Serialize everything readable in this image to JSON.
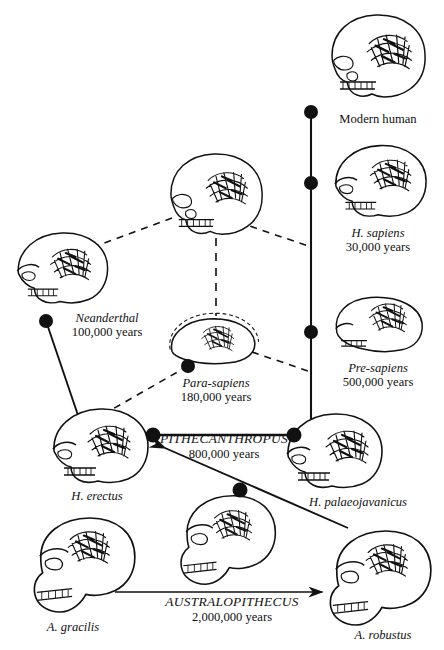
{
  "figure": {
    "type": "diagram",
    "background": "#ffffff",
    "ink": "#111111",
    "width": 444,
    "height": 650
  },
  "taxa": [
    {
      "id": "modern-human",
      "name": "Modern human",
      "age": "",
      "name_style": "roman",
      "cx": 378,
      "cy": 62,
      "label_x": 378,
      "label_y": 112
    },
    {
      "id": "h-sapiens",
      "name": "H. sapiens",
      "age": "30,000 years",
      "name_style": "italic",
      "cx": 380,
      "cy": 185,
      "label_x": 378,
      "label_y": 232
    },
    {
      "id": "pre-sapiens",
      "name": "Pre-sapiens",
      "age": "500,000 years",
      "name_style": "italic",
      "cx": 378,
      "cy": 325,
      "label_x": 378,
      "label_y": 367
    },
    {
      "id": "neanderthal",
      "name": "Neanderthal",
      "age": "100,000 years",
      "name_style": "italic",
      "cx": 62,
      "cy": 272,
      "label_x": 107,
      "label_y": 314
    },
    {
      "id": "para-sapiens",
      "name": "Para-sapiens",
      "age": "180,000 years",
      "name_style": "italic",
      "cx": 212,
      "cy": 340,
      "label_x": 216,
      "label_y": 379
    },
    {
      "id": "h-erectus",
      "name": "H. erectus",
      "age": "",
      "name_style": "italic",
      "cx": 100,
      "cy": 450,
      "label_x": 97,
      "label_y": 486
    },
    {
      "id": "h-palaeojavanicus",
      "name": "H. palaeojavanicus",
      "age": "",
      "name_style": "italic",
      "cx": 334,
      "cy": 455,
      "label_x": 356,
      "label_y": 500
    },
    {
      "id": "a-gracilis",
      "name": "A. gracilis",
      "age": "",
      "name_style": "italic",
      "cx": 73,
      "cy": 565,
      "label_x": 73,
      "label_y": 627
    },
    {
      "id": "a-robustus",
      "name": "A. robustus",
      "age": "",
      "name_style": "italic",
      "cx": 378,
      "cy": 578,
      "label_x": 382,
      "label_y": 635
    },
    {
      "id": "unnamed-middle",
      "name": "",
      "age": "",
      "name_style": "italic",
      "cx": 216,
      "cy": 200,
      "label_x": 0,
      "label_y": 0
    },
    {
      "id": "unnamed-lower",
      "name": "",
      "age": "",
      "name_style": "italic",
      "cx": 222,
      "cy": 540,
      "label_x": 0,
      "label_y": 0
    }
  ],
  "group_labels": [
    {
      "id": "pithecanthropus",
      "name": "PITHECANTHROPUS",
      "age": "800,000 years",
      "x": 222,
      "y": 434
    },
    {
      "id": "australopithecus",
      "name": "AUSTRALOPITHECUS",
      "age": "2,000,000 years",
      "x": 232,
      "y": 597
    }
  ],
  "nodes": [
    {
      "id": "node-modern-human",
      "x": 311,
      "y": 112,
      "r": 7.0
    },
    {
      "id": "node-h-sapiens",
      "x": 311,
      "y": 183,
      "r": 7.0
    },
    {
      "id": "node-pre-sapiens",
      "x": 311,
      "y": 332,
      "r": 7.0
    },
    {
      "id": "node-neanderthal",
      "x": 46,
      "y": 321,
      "r": 7.0
    },
    {
      "id": "node-para-sapiens",
      "x": 188,
      "y": 366,
      "r": 7.0
    },
    {
      "id": "node-pithec-left",
      "x": 153,
      "y": 435,
      "r": 7.5
    },
    {
      "id": "node-pithec-right",
      "x": 294,
      "y": 435,
      "r": 7.5
    },
    {
      "id": "node-australo",
      "x": 240,
      "y": 490,
      "r": 7.5
    }
  ],
  "edges": [
    {
      "id": "edge-right-trunk",
      "style": "solid",
      "from": "node-modern-human",
      "to": "node-pre-sapiens"
    },
    {
      "id": "edge-trunk-tail",
      "style": "solid",
      "from": "node-pre-sapiens",
      "to": "trunk-bottom"
    },
    {
      "id": "edge-neanderthal-erectus",
      "style": "solid",
      "from": "node-neanderthal",
      "to": "h-erectus-skull"
    },
    {
      "id": "edge-pithecanthropus",
      "style": "solid",
      "from": "node-pithec-left",
      "to": "node-pithec-right"
    },
    {
      "id": "edge-mid-to-neanderthal",
      "style": "dashed",
      "from": "unnamed-middle",
      "to": "neanderthal-skull"
    },
    {
      "id": "edge-mid-to-sapiens",
      "style": "dashed",
      "from": "unnamed-middle",
      "to": "h-sapiens-branch"
    },
    {
      "id": "edge-mid-to-para",
      "style": "dashed",
      "from": "unnamed-middle",
      "to": "para-sapiens-skull"
    },
    {
      "id": "edge-para-to-erectus",
      "style": "dashed",
      "from": "node-para-sapiens",
      "to": "h-erectus-skull"
    },
    {
      "id": "edge-para-to-presapiens",
      "style": "dashed",
      "from": "para-sapiens-skull",
      "to": "pre-sapiens-branch"
    }
  ],
  "arrows": [
    {
      "id": "arrow-australopithecus-to-erectus",
      "from_x": 348,
      "from_y": 528,
      "to_x": 165,
      "to_y": 448,
      "head": "start"
    },
    {
      "id": "arrow-australopithecus-base",
      "from_x": 115,
      "from_y": 592,
      "to_x": 320,
      "to_y": 592,
      "head": "end"
    }
  ]
}
